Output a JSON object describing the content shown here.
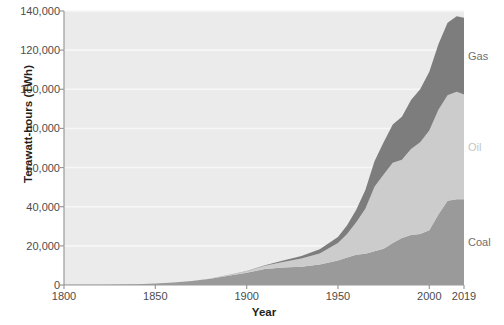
{
  "chart_data": {
    "type": "area",
    "stacked": true,
    "title": "",
    "subtitle": "",
    "xlabel": "Year",
    "ylabel": "Terawatt-hours (TWh)",
    "xlim": [
      1800,
      2019
    ],
    "ylim": [
      0,
      140000
    ],
    "grid": true,
    "legend_position": "right-inline",
    "x_ticks": [
      1800,
      1850,
      1900,
      1950,
      2000,
      2019
    ],
    "x_tick_labels": [
      "1800",
      "1850",
      "1900",
      "1950",
      "2000",
      "2019"
    ],
    "y_ticks": [
      0,
      20000,
      40000,
      60000,
      80000,
      100000,
      120000,
      140000
    ],
    "y_tick_labels": [
      "0",
      "20,000",
      "40,000",
      "60,000",
      "80,000",
      "100,000",
      "120,000",
      "140,000"
    ],
    "x": [
      1800,
      1810,
      1820,
      1830,
      1840,
      1850,
      1860,
      1870,
      1880,
      1890,
      1900,
      1910,
      1920,
      1930,
      1940,
      1950,
      1955,
      1960,
      1965,
      1970,
      1975,
      1980,
      1985,
      1990,
      1995,
      2000,
      2005,
      2010,
      2015,
      2019
    ],
    "series": [
      {
        "name": "Coal",
        "color": "#9a9a9a",
        "label_color": "#6f6f6f",
        "values": [
          97,
          128,
          175,
          250,
          400,
          750,
          1250,
          2000,
          3200,
          4700,
          6300,
          8200,
          9000,
          9300,
          10500,
          12500,
          14000,
          15500,
          16000,
          17200,
          18500,
          21500,
          24000,
          25500,
          26000,
          28000,
          36000,
          43000,
          43800,
          43800
        ]
      },
      {
        "name": "Oil",
        "color": "#cccccc",
        "label_color": "#c4c4c4",
        "values": [
          0,
          0,
          0,
          0,
          0,
          0,
          10,
          40,
          120,
          300,
          700,
          1600,
          2800,
          4200,
          5600,
          9000,
          12000,
          16500,
          23000,
          33000,
          38000,
          41000,
          40000,
          44000,
          47000,
          51000,
          53500,
          54000,
          55000,
          53500
        ]
      },
      {
        "name": "Gas",
        "color": "#7d7d7d",
        "label_color": "#6f6f6f",
        "values": [
          0,
          0,
          0,
          0,
          0,
          0,
          0,
          5,
          20,
          60,
          150,
          350,
          700,
          1300,
          2200,
          3000,
          4500,
          6500,
          9500,
          13000,
          16500,
          19500,
          22000,
          25000,
          27000,
          30000,
          33500,
          37000,
          38500,
          39300
        ]
      }
    ]
  },
  "axes": {
    "y_axis_title": "Terawatt-hours (TWh)",
    "x_axis_title": "Year"
  },
  "colors": {
    "plot_background": "#ebebeb",
    "grid": "#f7f7f7",
    "axis_line": "#9a9a9a",
    "tick_text": "#4c4c4c",
    "title_text": "#231f20",
    "page_background": "#ffffff"
  }
}
